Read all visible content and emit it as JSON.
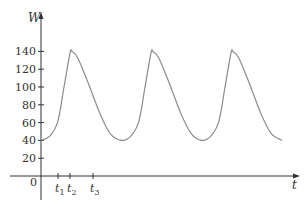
{
  "chart_data": {
    "type": "line",
    "title": "",
    "xlabel": "t",
    "ylabel": "W",
    "ylim": [
      0,
      150
    ],
    "yticks": [
      20,
      40,
      60,
      80,
      100,
      120,
      140
    ],
    "ytick_labels": [
      "20",
      "40",
      "60",
      "80",
      "100",
      "120",
      "140"
    ],
    "origin_label": "0",
    "xtick_labels": [
      "t1",
      "t2",
      "t3"
    ],
    "xticks_px": [
      58,
      70,
      93
    ],
    "grid": false,
    "legend": null,
    "series": [
      {
        "name": "W(t)",
        "color": "#8c8c8c",
        "description": "periodic oscillation between ~40 and ~140; three peaks",
        "x_px": [
          41,
          50,
          58,
          64,
          70,
          72,
          78,
          88,
          100,
          110,
          122,
          131,
          139,
          145,
          151,
          153,
          159,
          169,
          181,
          191,
          202,
          211,
          219,
          225,
          231,
          233,
          239,
          249,
          261,
          271,
          282
        ],
        "values": [
          40,
          45,
          62,
          100,
          138,
          140,
          132,
          105,
          70,
          48,
          40,
          45,
          62,
          100,
          138,
          140,
          132,
          105,
          70,
          48,
          40,
          45,
          62,
          100,
          138,
          140,
          132,
          105,
          70,
          48,
          40
        ]
      }
    ],
    "peaks": [
      140,
      140,
      140
    ],
    "troughs": [
      40,
      40,
      40,
      40
    ]
  },
  "colors": {
    "axis": "#333333",
    "curve": "#8c8c8c",
    "background": "#ffffff"
  }
}
